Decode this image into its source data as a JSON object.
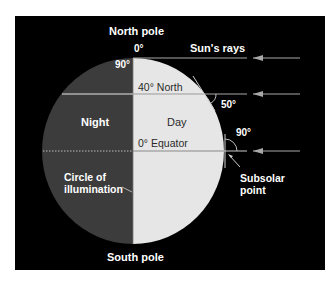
{
  "colors": {
    "background": "#000000",
    "night": "#3c3c3c",
    "day": "#e6e6e6",
    "rays": "#a8a8a8",
    "text_light": "#ffffff",
    "text_dark": "#2a2a2a"
  },
  "labels": {
    "north_pole": "North pole",
    "south_pole": "South pole",
    "suns_rays": "Sun's rays",
    "pole_angle": "0°",
    "pole_latitude": "90°",
    "latitude_40": "40° North",
    "angle_50": "50°",
    "night": "Night",
    "day": "Day",
    "equator": "0° Equator",
    "angle_90": "90°",
    "circle_of_illumination_1": "Circle of",
    "circle_of_illumination_2": "illumination",
    "subsolar_1": "Subsolar",
    "subsolar_2": "point"
  },
  "rays": [
    {
      "name": "ray-north-pole",
      "latitude": "90°",
      "incidence_angle": "0°"
    },
    {
      "name": "ray-40-north",
      "latitude": "40° North",
      "incidence_angle": "50°"
    },
    {
      "name": "ray-equator",
      "latitude": "0° Equator",
      "incidence_angle": "90°"
    }
  ]
}
